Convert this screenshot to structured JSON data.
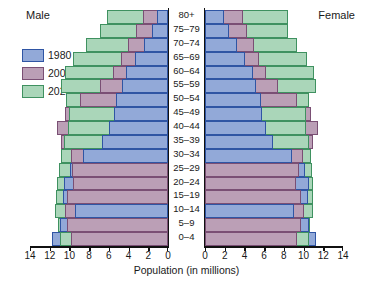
{
  "labels": {
    "male": "Male",
    "female": "Female",
    "xaxis_title": "Population (in millions)"
  },
  "legend": {
    "position": "top-left",
    "items": [
      {
        "label": "1980",
        "color": "#92a9d8",
        "border": "#2f55a4"
      },
      {
        "label": "2002",
        "color": "#bb9fb6",
        "border": "#7a4f74"
      },
      {
        "label": "2025",
        "color": "#aad6b9",
        "border": "#3f9160"
      }
    ]
  },
  "chart_data": {
    "type": "bar",
    "subtype": "population-pyramid",
    "title": "",
    "xlabel": "Population (in millions)",
    "ylabel": "",
    "grid": false,
    "xlim": [
      0,
      14
    ],
    "xticks": [
      0,
      2,
      4,
      6,
      8,
      10,
      12,
      14
    ],
    "left_tick_labels": [
      "14",
      "12",
      "10",
      "8",
      "6",
      "4",
      "2",
      "0"
    ],
    "right_tick_labels": [
      "0",
      "2",
      "4",
      "6",
      "8",
      "10",
      "12",
      "14"
    ],
    "categories": [
      "80+",
      "75–79",
      "70–74",
      "65–69",
      "60–64",
      "55–59",
      "50–54",
      "45–49",
      "40–44",
      "35–39",
      "30–34",
      "25–29",
      "20–24",
      "15–19",
      "10–14",
      "5–9",
      "0–4"
    ],
    "series": [
      {
        "name": "1980",
        "color": "#92a9d8",
        "male": [
          1.1,
          1.6,
          2.4,
          3.4,
          4.3,
          4.7,
          5.3,
          5.5,
          6.0,
          6.7,
          8.6,
          9.9,
          10.6,
          10.7,
          9.4,
          11.0,
          11.8
        ],
        "female": [
          1.9,
          2.4,
          3.2,
          4.1,
          4.9,
          5.2,
          5.7,
          5.8,
          6.2,
          6.9,
          8.8,
          10.1,
          10.6,
          10.4,
          9.0,
          10.5,
          11.3
        ]
      },
      {
        "name": "2002",
        "color": "#bb9fb6",
        "male": [
          2.5,
          3.2,
          4.1,
          4.8,
          5.6,
          6.9,
          8.9,
          10.5,
          11.3,
          10.9,
          9.8,
          9.7,
          9.6,
          10.2,
          10.5,
          10.2,
          9.8
        ],
        "female": [
          3.9,
          4.3,
          5.0,
          5.5,
          6.2,
          7.4,
          9.3,
          10.8,
          11.5,
          11.0,
          9.9,
          9.5,
          9.2,
          9.7,
          10.0,
          9.7,
          9.3
        ]
      },
      {
        "name": "2025",
        "color": "#aad6b9",
        "male": [
          6.2,
          6.9,
          8.3,
          9.6,
          10.5,
          10.9,
          10.3,
          10.0,
          10.1,
          10.6,
          10.9,
          11.1,
          11.3,
          11.4,
          11.5,
          11.2,
          11.0
        ],
        "female": [
          8.4,
          8.4,
          9.3,
          10.3,
          11.1,
          11.3,
          10.6,
          10.2,
          10.2,
          10.6,
          10.8,
          10.9,
          11.0,
          11.0,
          11.0,
          10.7,
          10.5
        ]
      }
    ]
  }
}
